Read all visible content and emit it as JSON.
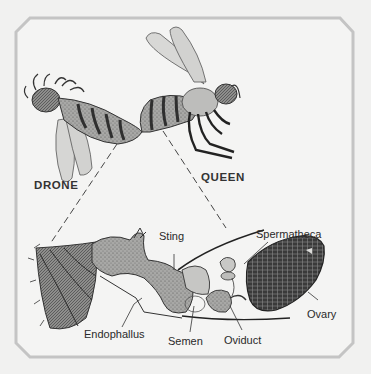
{
  "figure": {
    "frame": {
      "shape": "chamfered-rectangle",
      "border_color": "#c4c4c4",
      "background": "#f1f1f0"
    }
  },
  "labels": {
    "drone": "DRONE",
    "queen": "QUEEN",
    "sting": "Sting",
    "spermatheca": "Spermatheca",
    "ovary": "Ovary",
    "endophallus": "Endophallus",
    "semen": "Semen",
    "oviduct": "Oviduct"
  },
  "colors": {
    "ink": "#2a2a2a",
    "wing_fill": "#d6d6d4",
    "body_fill": "#9a9a98",
    "dark_band": "#3a3a3a",
    "tissue_fill": "#b8b8b6",
    "ovary_fill": "#2e2e2e"
  }
}
